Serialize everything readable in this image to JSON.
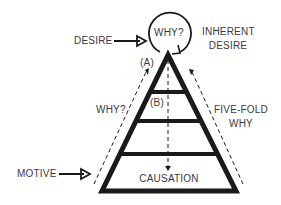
{
  "diagram": {
    "type": "pyramid-concept",
    "labels": {
      "desire": "DESIRE",
      "why_circle": "WHY?",
      "inherent_line1": "INHERENT",
      "inherent_line2": "DESIRE",
      "point_a": "(A)",
      "point_b": "(B)",
      "why_left": "WHY?",
      "fivefold_line1": "FIVE-FOLD",
      "fivefold_line2": "WHY",
      "motive": "MOTIVE",
      "causation": "CAUSATION"
    },
    "colors": {
      "stroke": "#1a1a1a",
      "text": "#3a3a3a",
      "background": "#ffffff"
    },
    "pyramid_levels": 4
  }
}
